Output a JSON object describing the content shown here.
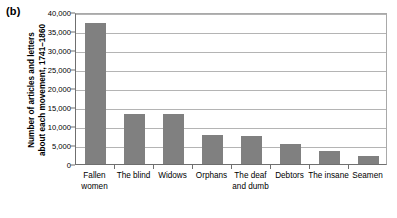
{
  "panel": {
    "label": "(b)"
  },
  "chart_data": {
    "type": "bar",
    "title": "",
    "subtitle": "",
    "xlabel": "",
    "ylabel": "Number of articles and letters about each movement, 1741–1860",
    "ylabel_lines": [
      "Number of articles and letters",
      "about each movement, 1741–1860"
    ],
    "categories": [
      "Fallen women",
      "The blind",
      "Widows",
      "Orphans",
      "The deaf and dumb",
      "Debtors",
      "The insane",
      "Seamen"
    ],
    "category_lines": [
      [
        "Fallen",
        "women"
      ],
      [
        "The blind",
        ""
      ],
      [
        "Widows",
        ""
      ],
      [
        "Orphans",
        ""
      ],
      [
        "The deaf",
        "and dumb"
      ],
      [
        "Debtors",
        ""
      ],
      [
        "The insane",
        ""
      ],
      [
        "Seamen",
        ""
      ]
    ],
    "values": [
      37000,
      13200,
      13200,
      7700,
      7400,
      5300,
      3500,
      2200
    ],
    "ylim": [
      0,
      40000
    ],
    "yticks": [
      0,
      5000,
      10000,
      15000,
      20000,
      25000,
      30000,
      35000,
      40000
    ],
    "ytick_labels": [
      "0",
      "5,000",
      "10,000",
      "15,000",
      "20,000",
      "25,000",
      "30,000",
      "35,000",
      "40,000"
    ],
    "grid": true,
    "legend": false,
    "legend_position": "none",
    "bar_color": "#808080",
    "axis_color": "#6f6f6f",
    "grid_color": "#b4b4b4",
    "background_color": "#ffffff"
  }
}
